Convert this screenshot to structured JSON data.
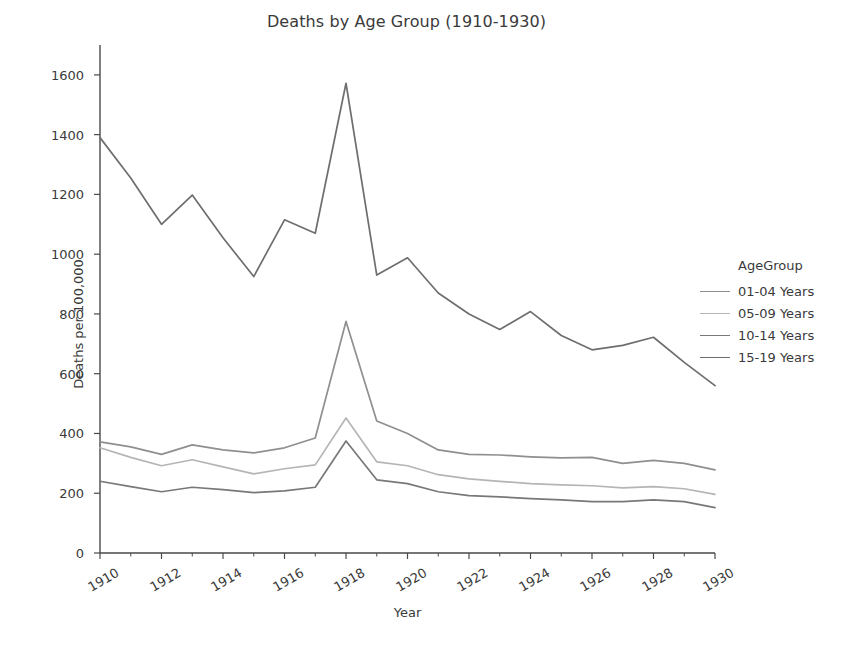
{
  "chart_data": {
    "type": "line",
    "title": "Deaths by Age Group (1910-1930)",
    "xlabel": "Year",
    "ylabel": "Deaths per 100,000",
    "legend_title": "AgeGroup",
    "legend_position": "right",
    "grid": false,
    "xlim": [
      1910,
      1930
    ],
    "ylim": [
      0,
      1700
    ],
    "yticks": [
      0,
      200,
      400,
      600,
      800,
      1000,
      1200,
      1400,
      1600
    ],
    "ytick_labels": [
      "0",
      "200",
      "400",
      "600",
      "800",
      "1000",
      "1200",
      "1400",
      "1600"
    ],
    "xticks": [
      1910,
      1912,
      1914,
      1916,
      1918,
      1920,
      1922,
      1924,
      1926,
      1928,
      1930
    ],
    "xtick_labels": [
      "1910",
      "1912",
      "1914",
      "1916",
      "1918",
      "1920",
      "1922",
      "1924",
      "1926",
      "1928",
      "1930"
    ],
    "x": [
      1910,
      1911,
      1912,
      1913,
      1914,
      1915,
      1916,
      1917,
      1918,
      1919,
      1920,
      1921,
      1922,
      1923,
      1924,
      1925,
      1926,
      1927,
      1928,
      1929,
      1930
    ],
    "series": [
      {
        "name": "01-04 Years",
        "color": "#8f8f8f",
        "values": [
          372,
          355,
          330,
          362,
          345,
          335,
          352,
          385,
          775,
          442,
          400,
          345,
          330,
          328,
          322,
          318,
          320,
          300,
          310,
          300,
          278
        ]
      },
      {
        "name": "05-09 Years",
        "color": "#b5b5b5",
        "values": [
          352,
          320,
          292,
          312,
          288,
          265,
          282,
          295,
          452,
          305,
          292,
          262,
          248,
          240,
          232,
          228,
          225,
          218,
          222,
          215,
          196
        ]
      },
      {
        "name": "10-14 Years",
        "color": "#787878",
        "values": [
          240,
          222,
          205,
          220,
          212,
          202,
          208,
          220,
          375,
          245,
          232,
          205,
          192,
          188,
          182,
          178,
          172,
          172,
          178,
          172,
          152
        ]
      },
      {
        "name": "15-19 Years",
        "color": "#6e6e6e",
        "values": [
          1390,
          1255,
          1100,
          1198,
          1055,
          925,
          1115,
          1070,
          1572,
          930,
          988,
          870,
          800,
          748,
          808,
          728,
          680,
          695,
          722,
          638,
          560
        ]
      }
    ]
  },
  "axes": {
    "ylabel": "Deaths per 100,000",
    "xlabel": "Year"
  },
  "legend": {
    "title": "AgeGroup",
    "items": [
      {
        "label": "01-04 Years",
        "color": "#8f8f8f"
      },
      {
        "label": "05-09 Years",
        "color": "#b5b5b5"
      },
      {
        "label": "10-14 Years",
        "color": "#787878"
      },
      {
        "label": "15-19 Years",
        "color": "#6e6e6e"
      }
    ]
  },
  "colors": {
    "axis": "#4a4a4a",
    "text": "#3a3a3a",
    "background": "#ffffff"
  }
}
